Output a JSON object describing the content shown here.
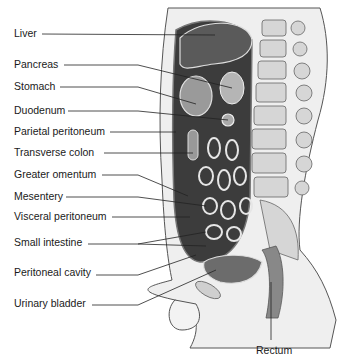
{
  "figure": {
    "labels_left": [
      {
        "text": "Liver",
        "x": 14,
        "y": 27
      },
      {
        "text": "Pancreas",
        "x": 14,
        "y": 58
      },
      {
        "text": "Stomach",
        "x": 14,
        "y": 80
      },
      {
        "text": "Duodenum",
        "x": 14,
        "y": 104
      },
      {
        "text": "Parietal peritoneum",
        "x": 14,
        "y": 125
      },
      {
        "text": "Transverse colon",
        "x": 14,
        "y": 146
      },
      {
        "text": "Greater omentum",
        "x": 14,
        "y": 168
      },
      {
        "text": "Mesentery",
        "x": 14,
        "y": 190
      },
      {
        "text": "Visceral peritoneum",
        "x": 14,
        "y": 210
      },
      {
        "text": "Small intestine",
        "x": 14,
        "y": 236
      },
      {
        "text": "Peritoneal cavity",
        "x": 14,
        "y": 266
      },
      {
        "text": "Urinary bladder",
        "x": 14,
        "y": 297
      }
    ],
    "labels_bottom": [
      {
        "text": "Rectum",
        "x": 256,
        "y": 344
      }
    ],
    "colors": {
      "organ_dark": "#3a3a3a",
      "organ_mid": "#8a8a8a",
      "organ_light": "#cfcfcf",
      "bone": "#d8d8d8",
      "line": "#222222",
      "background": "#ffffff"
    }
  }
}
